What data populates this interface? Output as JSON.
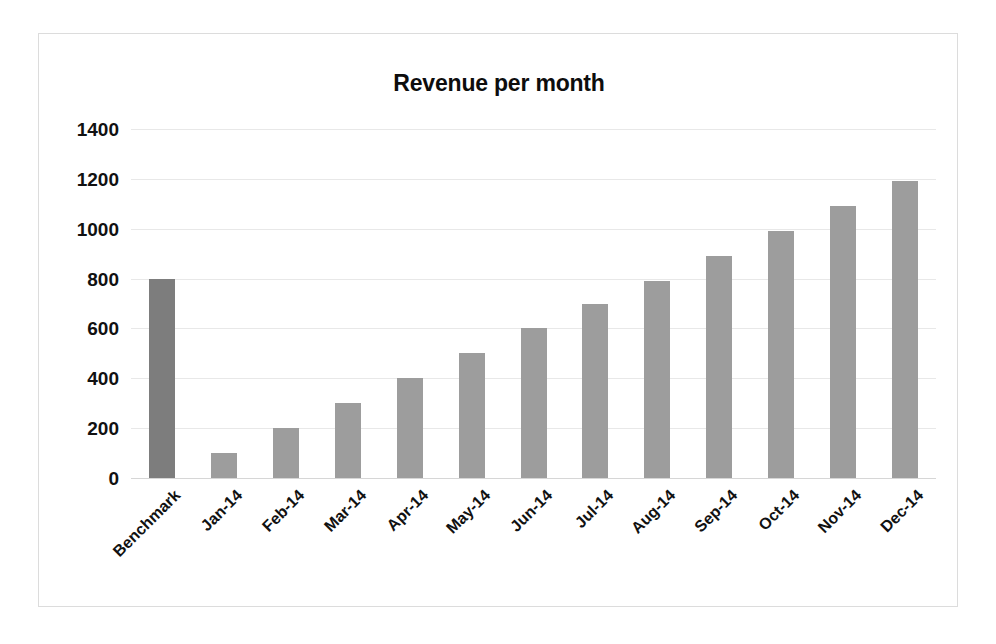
{
  "chart_data": {
    "type": "bar",
    "title": "Revenue per month",
    "xlabel": "",
    "ylabel": "",
    "categories": [
      "Benchmark",
      "Jan-14",
      "Feb-14",
      "Mar-14",
      "Apr-14",
      "May-14",
      "Jun-14",
      "Jul-14",
      "Aug-14",
      "Sep-14",
      "Oct-14",
      "Nov-14",
      "Dec-14"
    ],
    "values": [
      800,
      100,
      200,
      300,
      400,
      500,
      600,
      700,
      790,
      890,
      990,
      1090,
      1190
    ],
    "bar_colors": [
      "#7d7d7d",
      "#9d9d9d",
      "#9d9d9d",
      "#9d9d9d",
      "#9d9d9d",
      "#9d9d9d",
      "#9d9d9d",
      "#9d9d9d",
      "#9d9d9d",
      "#9d9d9d",
      "#9d9d9d",
      "#9d9d9d",
      "#9d9d9d"
    ],
    "ylim": [
      0,
      1400
    ],
    "yticks": [
      0,
      200,
      400,
      600,
      800,
      1000,
      1200,
      1400
    ],
    "ytick_labels": [
      "0",
      "200",
      "400",
      "600",
      "800",
      "1000",
      "1200",
      "1400"
    ],
    "grid": true,
    "legend": false,
    "xlabel_rotation": 45,
    "colors": {
      "benchmark_bar": "#7d7d7d",
      "month_bar": "#9d9d9d",
      "gridline": "#e8e8e8",
      "frame_border": "#dcdcdc",
      "text": "#111111",
      "background": "#ffffff"
    }
  }
}
